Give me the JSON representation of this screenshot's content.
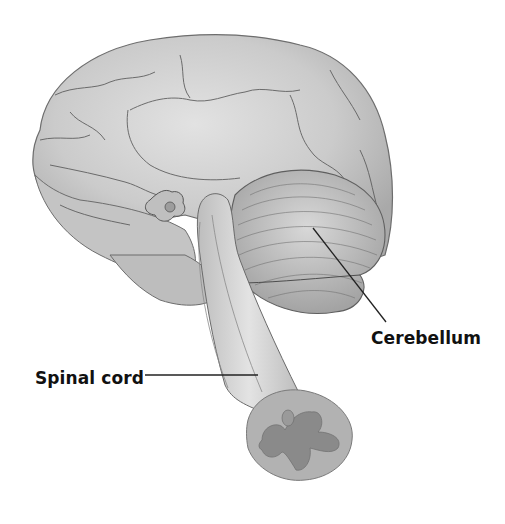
{
  "diagram": {
    "colors": {
      "background": "#ffffff",
      "cerebrum": "#c9c9c9",
      "cerebrum_highlight": "#e4e4e4",
      "sulcus_lines": "#5a5a5a",
      "cerebellum": "#b9b9b9",
      "spinal_cord": "#d2d2d2",
      "gray_matter": "#8a8a8a",
      "leader_line": "#222222",
      "label_text": "#111111"
    },
    "labels": [
      {
        "text": "Cerebellum",
        "leader_from": [
          313,
          228
        ],
        "leader_to": [
          386,
          322
        ]
      },
      {
        "text": "Spinal cord",
        "leader_from": [
          145,
          375
        ],
        "leader_to": [
          258,
          375
        ]
      }
    ]
  }
}
